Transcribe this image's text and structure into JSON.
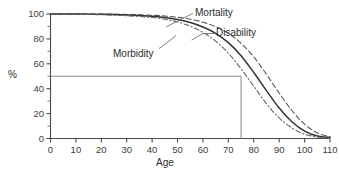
{
  "chart_data": {
    "type": "line",
    "title": "",
    "xlabel": "Age",
    "ylabel": "%",
    "xlim": [
      0,
      110
    ],
    "ylim": [
      0,
      100
    ],
    "grid": false,
    "legend_position": "inline-annotations",
    "x_ticks": [
      0,
      10,
      20,
      30,
      40,
      50,
      60,
      70,
      80,
      90,
      100,
      110
    ],
    "y_ticks": [
      0,
      20,
      40,
      60,
      80,
      100
    ],
    "y_minor_ticks": [
      10,
      30,
      50,
      70,
      90
    ],
    "x": [
      0,
      10,
      20,
      30,
      40,
      45,
      50,
      55,
      60,
      65,
      70,
      75,
      80,
      85,
      90,
      95,
      100,
      105,
      110
    ],
    "series": [
      {
        "name": "Mortality",
        "style": "dashed",
        "color": "#555555",
        "values": [
          100,
          100,
          100,
          99.6,
          99,
          98.4,
          97.4,
          95.8,
          93.4,
          89.8,
          84.5,
          76.5,
          65.5,
          51.5,
          36.5,
          22.5,
          11.5,
          4.5,
          1.5
        ]
      },
      {
        "name": "Disability",
        "style": "solid",
        "color": "#333333",
        "values": [
          100,
          100,
          99.8,
          99.2,
          98.2,
          97.2,
          95.6,
          93.2,
          89.6,
          84.5,
          77.0,
          66.5,
          53.0,
          38.5,
          24.5,
          13.5,
          6.0,
          2.0,
          0.8
        ]
      },
      {
        "name": "Morbidity",
        "style": "dash-dot",
        "color": "#666666",
        "values": [
          100,
          99.8,
          99.4,
          98.6,
          97.2,
          95.8,
          93.6,
          90.2,
          85.2,
          78.2,
          68.5,
          56.0,
          42.0,
          28.0,
          16.5,
          8.5,
          3.5,
          1.2,
          0.4
        ]
      }
    ],
    "annotations": [
      {
        "label": "Mortality",
        "kind": "curve-label"
      },
      {
        "label": "Disability",
        "kind": "curve-label"
      },
      {
        "label": "Morbidity",
        "kind": "curve-label"
      },
      {
        "label": "median-marker",
        "kind": "reference-lines",
        "y_value": 50,
        "x_value": 75
      }
    ],
    "reference_lines": {
      "horizontal_y": 50,
      "vertical_x": 75,
      "color": "#888888"
    }
  },
  "axes": {
    "y_title": "%",
    "x_title": "Age",
    "x_tick_labels": [
      "0",
      "10",
      "20",
      "30",
      "40",
      "50",
      "60",
      "70",
      "80",
      "90",
      "100",
      "110"
    ],
    "y_tick_labels": [
      "0",
      "20",
      "40",
      "60",
      "80",
      "100"
    ]
  },
  "labels": {
    "mortality": "Mortality",
    "disability": "Disability",
    "morbidity": "Morbidity"
  }
}
